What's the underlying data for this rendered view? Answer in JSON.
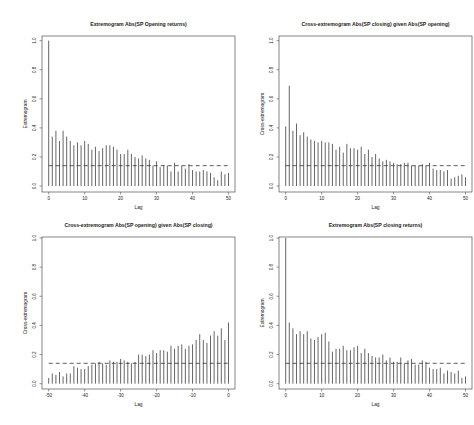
{
  "figure": {
    "layout": "2x2 grid",
    "background": "#ffffff",
    "bar_color": "#555555",
    "axis_color": "#333333",
    "threshold_line": "dashed"
  },
  "chart_data": [
    {
      "type": "bar",
      "title": "Extremogram Abs(SP Opening returns)",
      "xlabel": "Lag",
      "ylabel": "Extremogram",
      "xlim": [
        0,
        50
      ],
      "ylim": [
        0,
        1.0
      ],
      "xticks": [
        0,
        10,
        20,
        30,
        40,
        50
      ],
      "yticks": [
        0.0,
        0.2,
        0.4,
        0.6,
        0.8,
        1.0
      ],
      "ytick_labels": [
        "0.0",
        "0.2",
        "0.4",
        "0.6",
        "0.8",
        "1.0"
      ],
      "grid": false,
      "threshold": 0.14,
      "x": [
        0,
        1,
        2,
        3,
        4,
        5,
        6,
        7,
        8,
        9,
        10,
        11,
        12,
        13,
        14,
        15,
        16,
        17,
        18,
        19,
        20,
        21,
        22,
        23,
        24,
        25,
        26,
        27,
        28,
        29,
        30,
        31,
        32,
        33,
        34,
        35,
        36,
        37,
        38,
        39,
        40,
        41,
        42,
        43,
        44,
        45,
        46,
        47,
        48,
        49,
        50
      ],
      "values": [
        1.0,
        0.34,
        0.38,
        0.31,
        0.38,
        0.34,
        0.31,
        0.28,
        0.3,
        0.28,
        0.31,
        0.29,
        0.25,
        0.27,
        0.24,
        0.26,
        0.28,
        0.28,
        0.27,
        0.25,
        0.22,
        0.22,
        0.25,
        0.22,
        0.2,
        0.19,
        0.21,
        0.19,
        0.18,
        0.14,
        0.17,
        0.13,
        0.14,
        0.14,
        0.1,
        0.16,
        0.1,
        0.14,
        0.12,
        0.15,
        0.11,
        0.1,
        0.1,
        0.11,
        0.1,
        0.09,
        0.06,
        0.04,
        0.1,
        0.08,
        0.09
      ]
    },
    {
      "type": "bar",
      "title": "Cross-extremogram Abs(SP closing) given Abs(SP opening)",
      "xlabel": "Lag",
      "ylabel": "Cross-extremogram",
      "xlim": [
        0,
        50
      ],
      "ylim": [
        0,
        1.0
      ],
      "xticks": [
        0,
        10,
        20,
        30,
        40,
        50
      ],
      "yticks": [
        0.0,
        0.2,
        0.4,
        0.6,
        0.8,
        1.0
      ],
      "ytick_labels": [
        "0.0",
        "0.2",
        "0.4",
        "0.6",
        "0.8",
        "1.0"
      ],
      "grid": false,
      "threshold": 0.14,
      "x": [
        0,
        1,
        2,
        3,
        4,
        5,
        6,
        7,
        8,
        9,
        10,
        11,
        12,
        13,
        14,
        15,
        16,
        17,
        18,
        19,
        20,
        21,
        22,
        23,
        24,
        25,
        26,
        27,
        28,
        29,
        30,
        31,
        32,
        33,
        34,
        35,
        36,
        37,
        38,
        39,
        40,
        41,
        42,
        43,
        44,
        45,
        46,
        47,
        48,
        49,
        50
      ],
      "values": [
        0.41,
        0.69,
        0.38,
        0.43,
        0.35,
        0.37,
        0.34,
        0.32,
        0.31,
        0.3,
        0.31,
        0.3,
        0.3,
        0.29,
        0.25,
        0.27,
        0.23,
        0.29,
        0.26,
        0.26,
        0.25,
        0.27,
        0.22,
        0.25,
        0.2,
        0.22,
        0.19,
        0.17,
        0.18,
        0.17,
        0.16,
        0.15,
        0.15,
        0.16,
        0.16,
        0.14,
        0.14,
        0.14,
        0.15,
        0.14,
        0.16,
        0.12,
        0.11,
        0.11,
        0.1,
        0.11,
        0.05,
        0.06,
        0.07,
        0.08,
        0.06
      ]
    },
    {
      "type": "bar",
      "title": "Cross-extremogram Abs(SP opening) given Abs(SP closing)",
      "xlabel": "Lag",
      "ylabel": "Cross-extremogram",
      "xlim": [
        -50,
        0
      ],
      "ylim": [
        0,
        1.0
      ],
      "xticks": [
        -50,
        -40,
        -30,
        -20,
        -10,
        0
      ],
      "yticks": [
        0.0,
        0.2,
        0.4,
        0.6,
        0.8,
        1.0
      ],
      "ytick_labels": [
        "0.0",
        "0.2",
        "0.4",
        "0.6",
        "0.8",
        "1.0"
      ],
      "grid": false,
      "threshold": 0.14,
      "x": [
        -50,
        -49,
        -48,
        -47,
        -46,
        -45,
        -44,
        -43,
        -42,
        -41,
        -40,
        -39,
        -38,
        -37,
        -36,
        -35,
        -34,
        -33,
        -32,
        -31,
        -30,
        -29,
        -28,
        -27,
        -26,
        -25,
        -24,
        -23,
        -22,
        -21,
        -20,
        -19,
        -18,
        -17,
        -16,
        -15,
        -14,
        -13,
        -12,
        -11,
        -10,
        -9,
        -8,
        -7,
        -6,
        -5,
        -4,
        -3,
        -2,
        -1,
        0
      ],
      "values": [
        0.04,
        0.07,
        0.06,
        0.08,
        0.05,
        0.07,
        0.07,
        0.12,
        0.11,
        0.1,
        0.1,
        0.12,
        0.13,
        0.14,
        0.15,
        0.14,
        0.13,
        0.16,
        0.15,
        0.15,
        0.17,
        0.16,
        0.15,
        0.14,
        0.15,
        0.2,
        0.2,
        0.19,
        0.2,
        0.23,
        0.21,
        0.23,
        0.23,
        0.22,
        0.26,
        0.24,
        0.26,
        0.27,
        0.24,
        0.26,
        0.27,
        0.3,
        0.34,
        0.3,
        0.28,
        0.33,
        0.36,
        0.33,
        0.38,
        0.3,
        0.42
      ]
    },
    {
      "type": "bar",
      "title": "Extremogram Abs(SP closing returns)",
      "xlabel": "Lag",
      "ylabel": "Extremogram",
      "xlim": [
        0,
        50
      ],
      "ylim": [
        0,
        1.0
      ],
      "xticks": [
        0,
        10,
        20,
        30,
        40,
        50
      ],
      "yticks": [
        0.0,
        0.2,
        0.4,
        0.6,
        0.8,
        1.0
      ],
      "ytick_labels": [
        "0.0",
        "0.2",
        "0.4",
        "0.6",
        "0.8",
        "1.0"
      ],
      "grid": false,
      "threshold": 0.14,
      "x": [
        0,
        1,
        2,
        3,
        4,
        5,
        6,
        7,
        8,
        9,
        10,
        11,
        12,
        13,
        14,
        15,
        16,
        17,
        18,
        19,
        20,
        21,
        22,
        23,
        24,
        25,
        26,
        27,
        28,
        29,
        30,
        31,
        32,
        33,
        34,
        35,
        36,
        37,
        38,
        39,
        40,
        41,
        42,
        43,
        44,
        45,
        46,
        47,
        48,
        49,
        50
      ],
      "values": [
        1.0,
        0.42,
        0.38,
        0.34,
        0.36,
        0.34,
        0.36,
        0.31,
        0.3,
        0.32,
        0.34,
        0.35,
        0.29,
        0.22,
        0.24,
        0.24,
        0.26,
        0.23,
        0.23,
        0.25,
        0.26,
        0.21,
        0.24,
        0.21,
        0.19,
        0.18,
        0.18,
        0.2,
        0.16,
        0.18,
        0.15,
        0.15,
        0.18,
        0.14,
        0.16,
        0.17,
        0.13,
        0.13,
        0.16,
        0.15,
        0.11,
        0.1,
        0.1,
        0.11,
        0.07,
        0.09,
        0.08,
        0.07,
        0.09,
        0.04,
        0.05
      ]
    }
  ]
}
